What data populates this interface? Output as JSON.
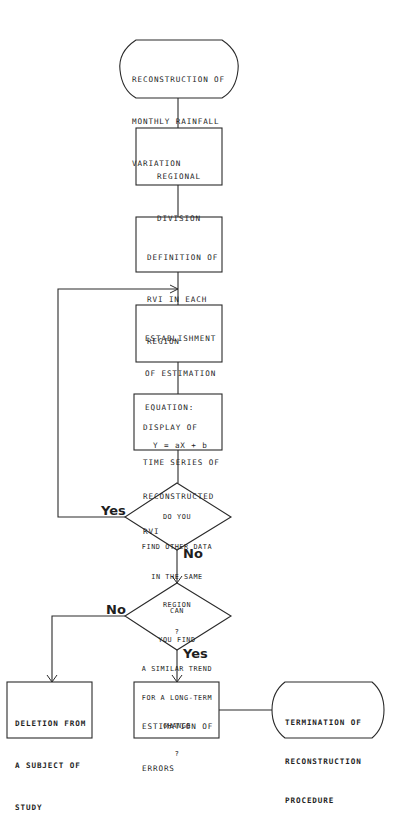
{
  "flowchart": {
    "nodes": {
      "start": {
        "type": "terminal",
        "lines": [
          "RECONSTRUCTION OF",
          "MONTHLY RAINFALL",
          "VARIATION"
        ]
      },
      "regional_division": {
        "type": "process",
        "lines": [
          "REGIONAL",
          "DIVISION"
        ]
      },
      "definition_rvi": {
        "type": "process",
        "lines": [
          "DEFINITION OF",
          "RVI IN EACH",
          "REGION"
        ]
      },
      "establishment": {
        "type": "process",
        "lines": [
          "ESTABLISHMENT",
          "OF ESTIMATION",
          "EQUATION:"
        ],
        "equation": "Y = aX + b"
      },
      "display_series": {
        "type": "process",
        "lines": [
          "DISPLAY OF",
          "TIME SERIES OF",
          "RECONSTRUCTED",
          "RVI"
        ]
      },
      "decision_other_data": {
        "type": "decision",
        "lines": [
          "DO YOU",
          "FIND OTHER DATA",
          "IN THE SAME",
          "REGION",
          "?"
        ]
      },
      "decision_trend": {
        "type": "decision",
        "lines": [
          "CAN",
          "YOU FIND",
          "A SIMILAR TREND",
          "FOR A LONG-TERM",
          "CHANGE",
          "?"
        ]
      },
      "deletion": {
        "type": "process",
        "lines": [
          "DELETION FROM",
          "A SUBJECT OF",
          "STUDY"
        ]
      },
      "estimation_errors": {
        "type": "process",
        "lines": [
          "ESTIMATION OF",
          "ERRORS"
        ]
      },
      "end": {
        "type": "terminal",
        "lines": [
          "TERMINATION OF",
          "RECONSTRUCTION",
          "PROCEDURE"
        ]
      }
    },
    "edge_labels": {
      "other_data_yes": "Yes",
      "other_data_no": "No",
      "trend_no": "No",
      "trend_yes": "Yes"
    },
    "edges": [
      {
        "from": "start",
        "to": "regional_division"
      },
      {
        "from": "regional_division",
        "to": "definition_rvi"
      },
      {
        "from": "definition_rvi",
        "to": "establishment"
      },
      {
        "from": "establishment",
        "to": "display_series"
      },
      {
        "from": "display_series",
        "to": "decision_other_data"
      },
      {
        "from": "decision_other_data",
        "to": "establishment",
        "label": "Yes"
      },
      {
        "from": "decision_other_data",
        "to": "decision_trend",
        "label": "No"
      },
      {
        "from": "decision_trend",
        "to": "deletion",
        "label": "No"
      },
      {
        "from": "decision_trend",
        "to": "estimation_errors",
        "label": "Yes"
      },
      {
        "from": "estimation_errors",
        "to": "end"
      }
    ]
  }
}
